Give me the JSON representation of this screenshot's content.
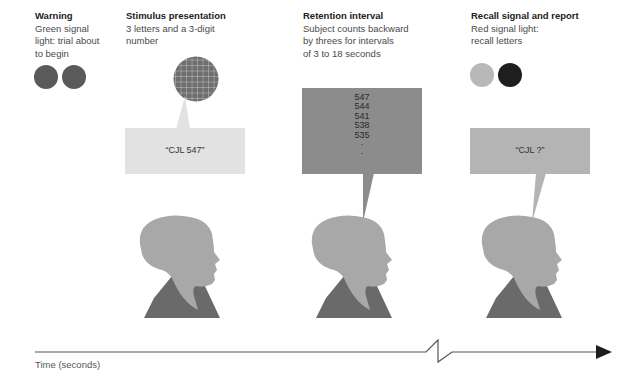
{
  "stages": [
    {
      "id": "warning",
      "title": "Warning",
      "description": "Green signal\nlight: trial about\nto begin"
    },
    {
      "id": "stimulus",
      "title": "Stimulus presentation",
      "description": "3 letters and a 3-digit\nnumber",
      "speech": "“CJL 547”"
    },
    {
      "id": "retention",
      "title": "Retention interval",
      "description": "Subject counts backward\nby threes for intervals\nof 3 to 18 seconds",
      "counts": [
        "547",
        "544",
        "541",
        "538",
        "535",
        "·",
        "·"
      ]
    },
    {
      "id": "recall",
      "title": "Recall signal and report",
      "description": "Red signal light:\nrecall letters",
      "speech": "“CJL ?”"
    }
  ],
  "timeline": {
    "label": "Time (seconds)"
  },
  "colors": {
    "warning_lights": "#5a5a5a",
    "recall_light_off": "#b8b8b8",
    "recall_light_on": "#1e1e1e",
    "stimulus_box": "#e2e2e2",
    "retention_box": "#8c8c8c",
    "recall_box": "#b4b4b4",
    "head": "#a8a8a8",
    "shoulders": "#6a6a6a",
    "grid_display": "#6e6e6e"
  }
}
